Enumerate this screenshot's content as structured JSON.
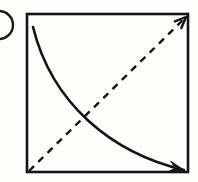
{
  "figure": {
    "kind": "hand-drawn-diagram",
    "canvas": {
      "width": 198,
      "height": 182,
      "background_color": "#fdfdfc",
      "ink_color": "#111111"
    },
    "square": {
      "label": "square-outline",
      "left": 27,
      "top": 14,
      "right": 188,
      "bottom": 172,
      "stroke_width": 2.6,
      "stroke_color": "#141414"
    },
    "solid_curve": {
      "label": "solid-curved-arrow",
      "start": [
        33,
        27
      ],
      "end": [
        184,
        170
      ],
      "control_1": [
        52,
        104
      ],
      "control_2": [
        112,
        153
      ],
      "stroke_width": 2.6,
      "stroke_color": "#141414",
      "arrowhead": "filled-triangle",
      "arrowhead_at": "end",
      "curvature": "convex toward lower-left"
    },
    "dashed_diagonal": {
      "label": "dashed-diagonal-arrow",
      "start": [
        29,
        171
      ],
      "end": [
        186,
        17
      ],
      "stroke_width": 2.4,
      "stroke_color": "#141414",
      "dash_length": 7,
      "gap_length": 6,
      "arrowhead": "open-chevron",
      "arrowhead_at": "end"
    },
    "crossing_point": [
      93,
      112
    ],
    "clipped_marker": {
      "label": "clipped-parenthesis-arc",
      "center": [
        -1,
        25
      ],
      "radius": 14,
      "stroke_width": 2.4,
      "stroke_color": "#1a1a1a",
      "note": "partial circle cut off by the left image edge"
    }
  }
}
